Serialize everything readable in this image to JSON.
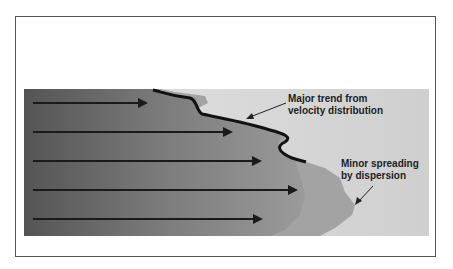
{
  "diagram": {
    "type": "plume-spreading",
    "colors": {
      "frame_border": "#555555",
      "dark_region": "#555555",
      "mid_region": "#9a9a9a",
      "light_region": "#d6d6d6",
      "arrow": "#1a1a1a",
      "front_line": "#111111"
    },
    "arrows": [
      {
        "y": 103,
        "x1": 33,
        "x2": 148
      },
      {
        "y": 132,
        "x1": 33,
        "x2": 233
      },
      {
        "y": 161,
        "x1": 33,
        "x2": 262
      },
      {
        "y": 190,
        "x1": 33,
        "x2": 298
      },
      {
        "y": 219,
        "x1": 33,
        "x2": 263
      }
    ],
    "annotations": [
      {
        "id": "major",
        "line1": "Major trend from",
        "line2": "velocity distribution"
      },
      {
        "id": "minor",
        "line1": "Minor spreading",
        "line2": "by dispersion"
      }
    ]
  }
}
